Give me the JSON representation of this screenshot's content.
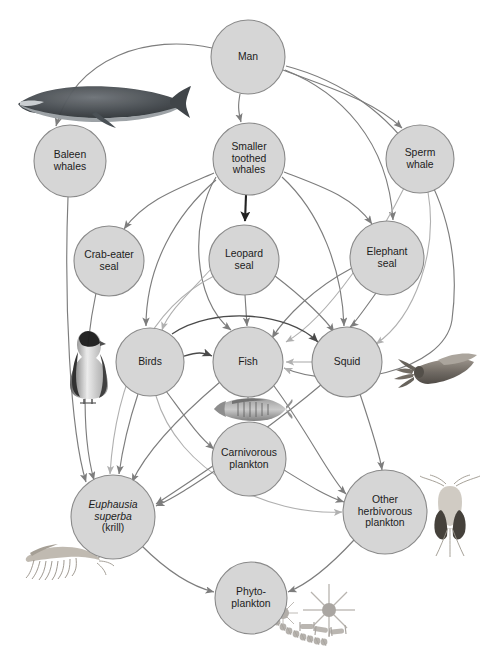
{
  "diagram": {
    "type": "food-web-diagram",
    "background_color": "#ffffff",
    "node_fill_color": "#d6d6d6",
    "node_stroke_color": "#8a8a8a",
    "arrow_color": "#7d7d7d",
    "width": 486,
    "height": 659
  },
  "nodes": [
    {
      "id": "man",
      "label_lines": [
        "Man"
      ],
      "cx": 248,
      "cy": 57,
      "r": 37,
      "italic_lines": 0
    },
    {
      "id": "baleen_whales",
      "label_lines": [
        "Baleen",
        "whales"
      ],
      "cx": 70,
      "cy": 161,
      "r": 36,
      "italic_lines": 0
    },
    {
      "id": "smaller_toothed_whales",
      "label_lines": [
        "Smaller",
        "toothed",
        "whales"
      ],
      "cx": 249,
      "cy": 159,
      "r": 36,
      "italic_lines": 0
    },
    {
      "id": "sperm_whale",
      "label_lines": [
        "Sperm",
        "whale"
      ],
      "cx": 420,
      "cy": 159,
      "r": 34,
      "italic_lines": 0
    },
    {
      "id": "crab_eater_seal",
      "label_lines": [
        "Crab-eater",
        "seal"
      ],
      "cx": 109,
      "cy": 261,
      "r": 35,
      "italic_lines": 0
    },
    {
      "id": "leopard_seal",
      "label_lines": [
        "Leopard",
        "seal"
      ],
      "cx": 244,
      "cy": 260,
      "r": 35,
      "italic_lines": 0
    },
    {
      "id": "elephant_seal",
      "label_lines": [
        "Elephant",
        "seal"
      ],
      "cx": 387,
      "cy": 258,
      "r": 37,
      "italic_lines": 0
    },
    {
      "id": "birds",
      "label_lines": [
        "Birds"
      ],
      "cx": 150,
      "cy": 362,
      "r": 34,
      "italic_lines": 0
    },
    {
      "id": "fish",
      "label_lines": [
        "Fish"
      ],
      "cx": 248,
      "cy": 362,
      "r": 35,
      "italic_lines": 0
    },
    {
      "id": "squid",
      "label_lines": [
        "Squid"
      ],
      "cx": 347,
      "cy": 362,
      "r": 35,
      "italic_lines": 0
    },
    {
      "id": "carnivorous_plankton",
      "label_lines": [
        "Carnivorous",
        "plankton"
      ],
      "cx": 249,
      "cy": 459,
      "r": 37,
      "italic_lines": 0
    },
    {
      "id": "krill",
      "label_lines": [
        "Euphausia",
        "superba",
        "(krill)"
      ],
      "cx": 113,
      "cy": 517,
      "r": 42,
      "italic_lines": 2
    },
    {
      "id": "other_herbivorous_plankton",
      "label_lines": [
        "Other",
        "herbivorous",
        "plankton"
      ],
      "cx": 385,
      "cy": 512,
      "r": 42,
      "italic_lines": 0
    },
    {
      "id": "phytoplankton",
      "label_lines": [
        "Phyto-",
        "plankton"
      ],
      "cx": 251,
      "cy": 598,
      "r": 36,
      "italic_lines": 0
    }
  ],
  "organisms": [
    {
      "id": "baleen-whale-illustration",
      "name": "baleen-whale-image",
      "x": 8,
      "y": 84,
      "w": 184,
      "h": 42
    },
    {
      "id": "penguin-illustration",
      "name": "penguin-image",
      "x": 67,
      "y": 329,
      "w": 44,
      "h": 72
    },
    {
      "id": "squid-illustration",
      "name": "squid-image",
      "x": 391,
      "y": 353,
      "w": 88,
      "h": 40
    },
    {
      "id": "fish-illustration",
      "name": "fish-image",
      "x": 204,
      "y": 397,
      "w": 88,
      "h": 24
    },
    {
      "id": "krill-illustration",
      "name": "krill-image",
      "x": 9,
      "y": 543,
      "w": 98,
      "h": 40
    },
    {
      "id": "copepod-illustration",
      "name": "copepod-image",
      "x": 420,
      "y": 473,
      "w": 60,
      "h": 84
    },
    {
      "id": "diatom-illustration",
      "name": "diatom-image",
      "x": 273,
      "y": 588,
      "w": 120,
      "h": 64
    }
  ],
  "edges": [
    {
      "from": "man",
      "to": "baleen_whales",
      "style": "normal"
    },
    {
      "from": "man",
      "to": "smaller_toothed_whales",
      "style": "normal"
    },
    {
      "from": "man",
      "to": "sperm_whale",
      "style": "normal"
    },
    {
      "from": "man",
      "to": "elephant_seal",
      "style": "normal"
    },
    {
      "from": "man",
      "to": "fish",
      "style": "normal"
    },
    {
      "from": "smaller_toothed_whales",
      "to": "crab_eater_seal",
      "style": "normal"
    },
    {
      "from": "smaller_toothed_whales",
      "to": "leopard_seal",
      "style": "thick"
    },
    {
      "from": "smaller_toothed_whales",
      "to": "elephant_seal",
      "style": "normal"
    },
    {
      "from": "smaller_toothed_whales",
      "to": "birds",
      "style": "normal"
    },
    {
      "from": "smaller_toothed_whales",
      "to": "fish",
      "style": "normal"
    },
    {
      "from": "smaller_toothed_whales",
      "to": "squid",
      "style": "normal"
    },
    {
      "from": "sperm_whale",
      "to": "squid",
      "style": "light"
    },
    {
      "from": "sperm_whale",
      "to": "fish",
      "style": "light"
    },
    {
      "from": "baleen_whales",
      "to": "krill",
      "style": "normal"
    },
    {
      "from": "crab_eater_seal",
      "to": "krill",
      "style": "normal"
    },
    {
      "from": "leopard_seal",
      "to": "birds",
      "style": "light"
    },
    {
      "from": "leopard_seal",
      "to": "fish",
      "style": "normal"
    },
    {
      "from": "leopard_seal",
      "to": "squid",
      "style": "normal"
    },
    {
      "from": "leopard_seal",
      "to": "krill",
      "style": "light"
    },
    {
      "from": "elephant_seal",
      "to": "fish",
      "style": "normal"
    },
    {
      "from": "elephant_seal",
      "to": "squid",
      "style": "normal"
    },
    {
      "from": "birds",
      "to": "fish",
      "style": "normal"
    },
    {
      "from": "birds",
      "to": "squid",
      "style": "normal"
    },
    {
      "from": "birds",
      "to": "krill",
      "style": "normal"
    },
    {
      "from": "birds",
      "to": "carnivorous_plankton",
      "style": "normal"
    },
    {
      "from": "fish",
      "to": "squid",
      "style": "light"
    },
    {
      "from": "fish",
      "to": "krill",
      "style": "normal"
    },
    {
      "from": "fish",
      "to": "carnivorous_plankton",
      "style": "normal"
    },
    {
      "from": "squid",
      "to": "fish",
      "style": "light"
    },
    {
      "from": "squid",
      "to": "krill",
      "style": "normal"
    },
    {
      "from": "squid",
      "to": "other_herbivorous_plankton",
      "style": "normal"
    },
    {
      "from": "carnivorous_plankton",
      "to": "krill",
      "style": "normal"
    },
    {
      "from": "carnivorous_plankton",
      "to": "other_herbivorous_plankton",
      "style": "normal"
    },
    {
      "from": "krill",
      "to": "phytoplankton",
      "style": "normal"
    },
    {
      "from": "other_herbivorous_plankton",
      "to": "phytoplankton",
      "style": "normal"
    },
    {
      "from": "fish",
      "to": "other_herbivorous_plankton",
      "style": "normal"
    },
    {
      "from": "birds",
      "to": "other_herbivorous_plankton",
      "style": "light"
    }
  ]
}
